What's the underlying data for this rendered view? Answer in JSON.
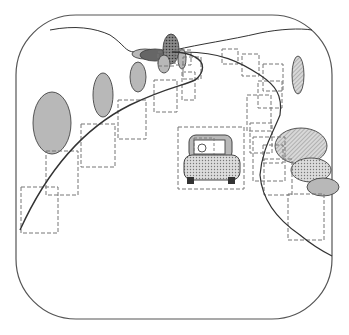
{
  "diagram": {
    "width": 349,
    "height": 335,
    "frame": {
      "x": 16,
      "y": 15,
      "w": 316,
      "h": 304,
      "r": 60,
      "stroke": "#555555"
    },
    "colors": {
      "line": "#333333",
      "dash": "#777777",
      "gray_fill": "#b8b8b8",
      "dark_fill": "#666666",
      "dotted_fill": "#c8c8c8",
      "hatched_fill": "#d0d0d0",
      "wheel": "#333333"
    },
    "horizon_path": "M50,30 C75,25 95,28 110,35 C125,45 125,52 135,52 L175,50 C200,44 230,40 260,33 C280,29 300,28 312,30",
    "road_left_path": "M17,243 C40,190 70,140 120,110 C150,92 180,80 195,65 C203,57 208,50 212,47 C218,43 222,44 222,50",
    "road_inner_path": "M35,225 C70,180 100,150 130,132 C160,114 190,112 198,95 C204,82 200,70 185,60 L165,52",
    "road_right_path": "M185,52 C220,52 240,62 260,75 C275,85 283,95 280,115 C272,135 262,150 260,175 C262,200 278,220 300,235 C312,245 320,250 332,256",
    "road_left_curve": "M20,230 C45,175 80,130 130,105 C165,88 185,85 195,80 C205,72 205,62 195,57 C188,53 178,52 172,52",
    "ellipses": [
      {
        "id": "tree-left-large",
        "cx": 52,
        "cy": 123,
        "rx": 19,
        "ry": 31,
        "fill": "gray"
      },
      {
        "id": "tree-left-mid",
        "cx": 103,
        "cy": 95,
        "rx": 10,
        "ry": 22,
        "fill": "gray"
      },
      {
        "id": "tree-left-small",
        "cx": 138,
        "cy": 77,
        "rx": 8,
        "ry": 15,
        "fill": "gray"
      },
      {
        "id": "bush-far-light",
        "cx": 145,
        "cy": 54,
        "rx": 13,
        "ry": 5,
        "fill": "gray"
      },
      {
        "id": "bush-far-dark",
        "cx": 155,
        "cy": 55,
        "rx": 15,
        "ry": 6,
        "fill": "dark"
      },
      {
        "id": "tree-far-dotted",
        "cx": 171,
        "cy": 49,
        "rx": 8,
        "ry": 15,
        "fill": "dark_dotted"
      },
      {
        "id": "tree-far-small",
        "cx": 164,
        "cy": 64,
        "rx": 6,
        "ry": 9,
        "fill": "gray"
      },
      {
        "id": "tree-far-narrow",
        "cx": 182,
        "cy": 59,
        "rx": 4,
        "ry": 10,
        "fill": "gray"
      },
      {
        "id": "tree-right-narrow",
        "cx": 298,
        "cy": 75,
        "rx": 6,
        "ry": 19,
        "fill": "hatched"
      },
      {
        "id": "bush-right-large",
        "cx": 301,
        "cy": 146,
        "rx": 26,
        "ry": 18,
        "fill": "hatched"
      },
      {
        "id": "bush-right-mid",
        "cx": 311,
        "cy": 170,
        "rx": 20,
        "ry": 12,
        "fill": "dotted"
      },
      {
        "id": "bush-right-small",
        "cx": 323,
        "cy": 187,
        "rx": 16,
        "ry": 9,
        "fill": "gray"
      }
    ],
    "dashed_boxes": [
      {
        "id": "box-1",
        "x": 21,
        "y": 187,
        "w": 37,
        "h": 46
      },
      {
        "id": "box-2",
        "x": 46,
        "y": 151,
        "w": 32,
        "h": 44
      },
      {
        "id": "box-3",
        "x": 81,
        "y": 124,
        "w": 34,
        "h": 43
      },
      {
        "id": "box-4",
        "x": 118,
        "y": 100,
        "w": 28,
        "h": 39
      },
      {
        "id": "box-5",
        "x": 154,
        "y": 80,
        "w": 23,
        "h": 32
      },
      {
        "id": "box-6",
        "x": 158,
        "y": 52,
        "w": 16,
        "h": 14
      },
      {
        "id": "box-7",
        "x": 175,
        "y": 50,
        "w": 16,
        "h": 15
      },
      {
        "id": "box-8",
        "x": 183,
        "y": 57,
        "w": 18,
        "h": 22
      },
      {
        "id": "box-9",
        "x": 182,
        "y": 72,
        "w": 13,
        "h": 28
      },
      {
        "id": "box-10",
        "x": 222,
        "y": 49,
        "w": 16,
        "h": 15
      },
      {
        "id": "box-11",
        "x": 242,
        "y": 54,
        "w": 17,
        "h": 22
      },
      {
        "id": "box-12",
        "x": 263,
        "y": 64,
        "w": 20,
        "h": 27
      },
      {
        "id": "box-13",
        "x": 258,
        "y": 81,
        "w": 24,
        "h": 27
      },
      {
        "id": "box-14",
        "x": 247,
        "y": 95,
        "w": 24,
        "h": 36
      },
      {
        "id": "box-15",
        "x": 250,
        "y": 123,
        "w": 22,
        "h": 30
      },
      {
        "id": "box-16",
        "x": 253,
        "y": 137,
        "w": 32,
        "h": 44
      },
      {
        "id": "box-17",
        "x": 264,
        "y": 159,
        "w": 28,
        "h": 36
      },
      {
        "id": "box-18",
        "x": 263,
        "y": 145,
        "w": 20,
        "h": 18
      },
      {
        "id": "box-19",
        "x": 288,
        "y": 194,
        "w": 36,
        "h": 46
      },
      {
        "id": "box-car",
        "x": 178,
        "y": 127,
        "w": 66,
        "h": 62
      }
    ],
    "car": {
      "body": {
        "x": 184,
        "y": 155,
        "w": 56,
        "h": 25,
        "r": 8
      },
      "cabin": {
        "x": 189,
        "y": 135,
        "w": 43,
        "h": 24,
        "r": 7
      },
      "window": {
        "x": 194,
        "y": 140,
        "w": 31,
        "h": 14
      },
      "window_box": {
        "x": 194,
        "y": 138,
        "w": 20,
        "h": 19
      },
      "light": {
        "cx": 202,
        "cy": 148,
        "r": 4
      },
      "wheel_left": {
        "x": 187,
        "y": 177,
        "w": 7,
        "h": 7
      },
      "wheel_right": {
        "x": 228,
        "y": 177,
        "w": 7,
        "h": 7
      }
    }
  }
}
